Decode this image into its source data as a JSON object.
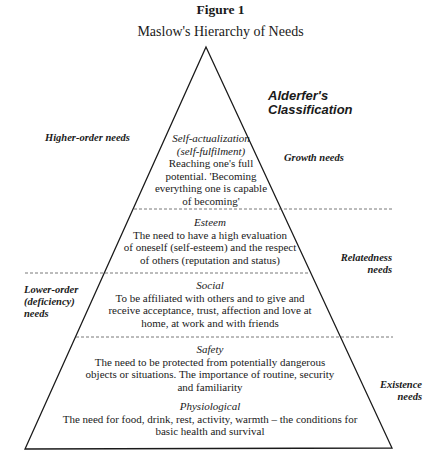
{
  "figure": {
    "number_label": "Figure 1",
    "title": "Maslow's Hierarchy of Needs"
  },
  "alderfer_heading": {
    "line1": "Alderfer's",
    "line2": "Classification"
  },
  "left_labels": {
    "higher": "Higher-order needs",
    "lower_line1": "Lower-order",
    "lower_line2": "(deficiency)",
    "lower_line3": "needs"
  },
  "right_labels": {
    "growth": "Growth needs",
    "relatedness_line1": "Relatedness",
    "relatedness_line2": "needs",
    "existence_line1": "Existence",
    "existence_line2": "needs"
  },
  "levels": [
    {
      "name_line1": "Self-actualization",
      "name_line2": "(self-fulfilment)",
      "desc_lines": [
        "Reaching one's full",
        "potential. 'Becoming",
        "everything one is capable",
        "of becoming'"
      ]
    },
    {
      "name_line1": "Esteem",
      "desc_lines": [
        "The need to have a high evaluation",
        "of oneself (self-esteem) and the respect",
        "of others (reputation and status)"
      ]
    },
    {
      "name_line1": "Social",
      "desc_lines": [
        "To be affiliated with others and to give and",
        "receive acceptance, trust, affection and love at",
        "home, at work and with friends"
      ]
    },
    {
      "name_line1": "Safety",
      "desc_lines": [
        "The need to be protected from potentially dangerous",
        "objects or situations. The importance of routine, security",
        "and familiarity"
      ]
    },
    {
      "name_line1": "Physiological",
      "desc_lines": [
        "The need for food, drink, rest, activity, warmth – the conditions for",
        "basic health and survival"
      ]
    }
  ],
  "colors": {
    "line": "#1a1a1a",
    "dashed": "#555555",
    "background": "#ffffff"
  }
}
